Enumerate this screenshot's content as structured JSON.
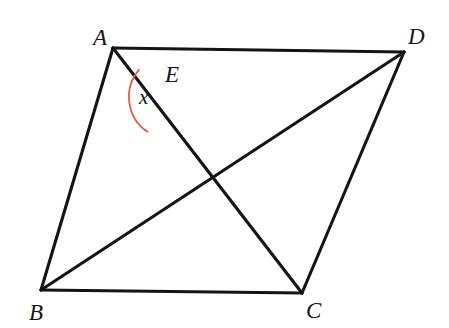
{
  "figure": {
    "background_color": "#ffffff",
    "line_color": "#141414",
    "angle_arc_color": "#d9604a",
    "width": 449,
    "height": 328,
    "points": {
      "A": {
        "label": "A",
        "x": 113,
        "y": 48,
        "label_x": 93,
        "label_y": 45
      },
      "B": {
        "label": "B",
        "x": 41,
        "y": 290,
        "label_x": 29,
        "label_y": 320
      },
      "C": {
        "label": "C",
        "x": 302,
        "y": 293,
        "label_x": 306,
        "label_y": 318
      },
      "D": {
        "label": "D",
        "x": 404,
        "y": 52,
        "label_x": 408,
        "label_y": 44
      },
      "E": {
        "label": "E",
        "x": 171,
        "y": 97,
        "label_x": 165,
        "label_y": 82
      }
    },
    "edges": [
      {
        "name": "segment-AD",
        "from": "A",
        "to": "D"
      },
      {
        "name": "segment-AB",
        "from": "A",
        "to": "B"
      },
      {
        "name": "segment-AC",
        "from": "A",
        "to": "C"
      },
      {
        "name": "segment-BD",
        "from": "B",
        "to": "D"
      },
      {
        "name": "segment-BC",
        "from": "B",
        "to": "C"
      },
      {
        "name": "segment-CD",
        "from": "C",
        "to": "D"
      }
    ],
    "angle": {
      "label": "x",
      "at_vertex": "E",
      "between": [
        "A",
        "B"
      ],
      "label_x": 139,
      "label_y": 104,
      "arc_radius": 42,
      "color": "#d9604a"
    }
  }
}
